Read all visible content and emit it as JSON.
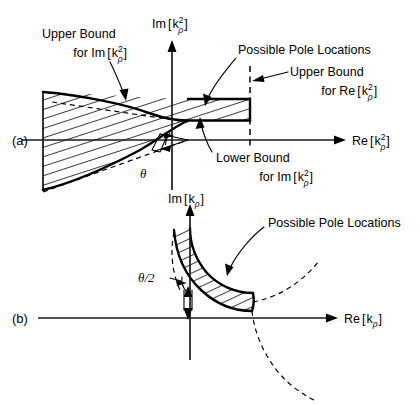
{
  "figure": {
    "background_color": "#ffffff",
    "ink_color": "#000000"
  },
  "panel_a": {
    "panel_label": "(a)",
    "axis_vertical_label": {
      "prefix": "Im",
      "open_bracket": "[",
      "base": "k",
      "superscript": "2",
      "subscript": "ρ",
      "close_bracket": "]"
    },
    "axis_horizontal_label": {
      "prefix": "Re",
      "open_bracket": "[",
      "base": "k",
      "superscript": "2",
      "subscript": "ρ",
      "close_bracket": "]"
    },
    "annotations": [
      {
        "name": "upper-bound-im",
        "line1": "Upper Bound",
        "line2_prefix": "for Im",
        "line2_base": "k",
        "line2_sup": "2",
        "line2_sub": "ρ"
      },
      {
        "name": "possible-pole-locations",
        "text": "Possible Pole Locations"
      },
      {
        "name": "upper-bound-re",
        "line1": "Upper Bound",
        "line2_prefix": "for Re",
        "line2_base": "k",
        "line2_sup": "2",
        "line2_sub": "ρ"
      },
      {
        "name": "lower-bound-im",
        "line1": "Lower Bound",
        "line2_prefix": "for Im",
        "line2_base": "k",
        "line2_sup": "2",
        "line2_sub": "ρ"
      }
    ],
    "angle_label": "θ"
  },
  "panel_b": {
    "panel_label": "(b)",
    "axis_vertical_label": {
      "prefix": "Im",
      "open_bracket": "[",
      "base": "k",
      "superscript": "",
      "subscript": "ρ",
      "close_bracket": "]"
    },
    "axis_horizontal_label": {
      "prefix": "Re",
      "open_bracket": "[",
      "base": "k",
      "superscript": "",
      "subscript": "ρ",
      "close_bracket": "]"
    },
    "annotations": [
      {
        "name": "possible-pole-locations",
        "text": "Possible Pole Locations"
      }
    ],
    "angle_label": "θ/2"
  }
}
